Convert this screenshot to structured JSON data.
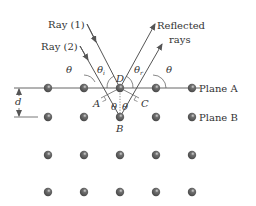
{
  "labels": {
    "ray1": "Ray (1)",
    "ray2": "Ray (2)",
    "reflected_line1": "Reflected",
    "reflected_line2": "rays",
    "plane_a": "Plane A",
    "plane_b": "Plane B",
    "point_a": "A",
    "point_b": "B",
    "point_c": "C",
    "point_d": "D",
    "spacing": "d",
    "theta": "θ",
    "theta_i_sym": "θ",
    "theta_i_sub": "i",
    "theta_r_sym": "θ",
    "theta_r_sub": "r"
  },
  "colors": {
    "atom": "#5a5a5a",
    "line": "#555555",
    "text": "#333333"
  }
}
